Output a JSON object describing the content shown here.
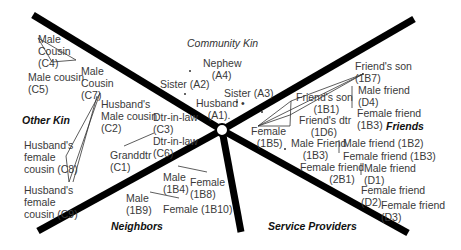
{
  "regions": {
    "community_kin": "Community Kin",
    "other_kin": "Other Kin",
    "friends": "Friends",
    "neighbors": "Neighbors",
    "service_providers": "Service Providers"
  },
  "nodes": {
    "nephew_a4": "Nephew\n   (A4)",
    "sister_a2": "Sister (A2)",
    "sister_a3": "Sister (A3)",
    "husband_a1": "Husband •\n    (A1).",
    "male_cousin_c4": "Male\nCousin\n(C4)",
    "male_cousin_c5": "Male cousin\n(C5)",
    "male_cousin_c7": "Male\nCousin\n(C7)",
    "husbands_male_cousin_c2": "Husband's\nMale cousin\n(C2)",
    "dtr_in_law_c3": "Dtr-in-law\n(C3)",
    "dtr_in_law_c6": "Dtr-in-law\n(C6)",
    "granddtr_c1": "Granddtr\n(C1)",
    "husbands_female_cousin_c8": "Husband's\nfemale\ncousin (C8)",
    "husbands_female_cousin_c9": "Husband's\nfemale\ncousin (C9)",
    "male_1b4": "Male\n(1B4)",
    "female_1b8": "Female\n(1B8)",
    "male_1b9": "Male\n(1B9)",
    "female_1b10": "Female (1B10)",
    "female_1b5": "Female\n  (1B5)",
    "friends_son_1b1": "Friend's son\n      (1B1)",
    "friends_dtr_1d6": "Friend's dtr\n    (1D6)",
    "male_friend_1b3": "Male Friend\n    (1B3)",
    "female_friend_2b1": "Female friend\n          (2B1)",
    "friends_son_1b7": "Friend's son\n(1B7)",
    "male_friend_d4": "Male friend\n(D4)",
    "female_friend_1b3_a": "Female friend\n(1B3)",
    "male_friend_1b2": "Male friend (1B2)",
    "female_friend_1b3_b": "Female friend (1B3)",
    "male_friend_d1": "Male friend\n(D1)",
    "female_friend_d2": "Female friend\n(D2)",
    "female_friend_d3": "Female friend\n(D3)"
  },
  "colors": {
    "divider": "#000000",
    "text": "#3a3a3a",
    "background": "#ffffff"
  }
}
